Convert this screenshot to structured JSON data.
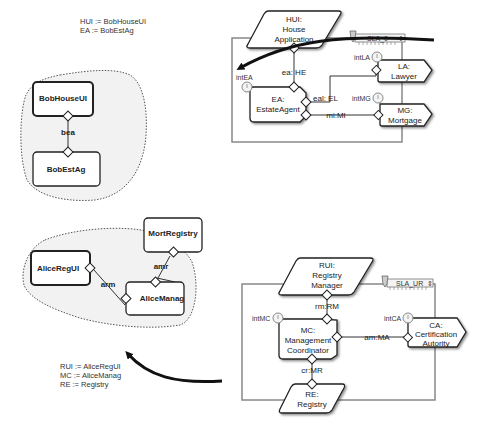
{
  "top_architecture": {
    "sla_label": "SLA_0",
    "components": {
      "hui": {
        "line1": "HUI:",
        "line2": "House",
        "line3": "Application"
      },
      "ea": {
        "line1": "EA:",
        "line2": "EstateAgent"
      },
      "la": {
        "line1": "LA:",
        "line2": "Lawyer"
      },
      "mg": {
        "line1": "MG:",
        "line2": "Mortgage"
      }
    },
    "wires": {
      "ea_he": "ea: HE",
      "eal_el": "eal: EL",
      "mi_mi": "mi:MI"
    },
    "interaction_labels": {
      "int_ea": "intEA",
      "int_la": "intLA",
      "int_mg": "intMG"
    }
  },
  "top_configuration": {
    "assignments": [
      "HUI := BobHouseUI",
      "EA := BobEstAg"
    ],
    "nodes": {
      "bob_house_ui": "BobHouseUI",
      "bob_est_ag": "BobEstAg"
    },
    "wire": "bea"
  },
  "bottom_architecture": {
    "sla_label": "SLA_UR",
    "components": {
      "rui": {
        "line1": "RUI:",
        "line2": "Registry",
        "line3": "Manager"
      },
      "mc": {
        "line1": "MC:",
        "line2": "Management",
        "line3": "Coordinator"
      },
      "ca": {
        "line1": "CA:",
        "line2": "Certification",
        "line3": "Autority"
      },
      "re": {
        "line1": "RE:",
        "line2": "Registry"
      }
    },
    "wires": {
      "rm_rm": "rm:RM",
      "am_ma": "am:MA",
      "cr_mr": "cr:MR"
    },
    "interaction_labels": {
      "int_mc": "intMC",
      "int_ca": "intCA"
    }
  },
  "bottom_configuration": {
    "assignments": [
      "RUI := AliceRegUI",
      "MC := AliceManag",
      "RE := Registry"
    ],
    "nodes": {
      "alice_reg_ui": "AliceRegUI",
      "alice_manag": "AliceManag",
      "mort_registry": "MortRegistry"
    },
    "wires": {
      "arm": "arm",
      "amr": "amr"
    }
  }
}
